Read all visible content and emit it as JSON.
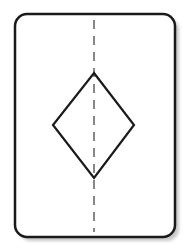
{
  "diagram": {
    "colors": {
      "background": "#ffffff",
      "card_fill": "#ffffff",
      "stroke": "#1a1a1a",
      "dash": "#555555",
      "shadow": "#c8c8c8"
    },
    "card": {
      "x": 15,
      "y": 14,
      "width": 160,
      "height": 223,
      "radius": 12,
      "stroke_width": 2.5
    },
    "diamond": {
      "points": [
        [
          94,
          73
        ],
        [
          134,
          125
        ],
        [
          94,
          178
        ],
        [
          53,
          125
        ]
      ],
      "stroke_width": 2.2
    },
    "symmetry_line": {
      "x": 94,
      "y1": 20,
      "y2": 232,
      "dash": "9 7",
      "stroke_width": 1.4
    }
  }
}
